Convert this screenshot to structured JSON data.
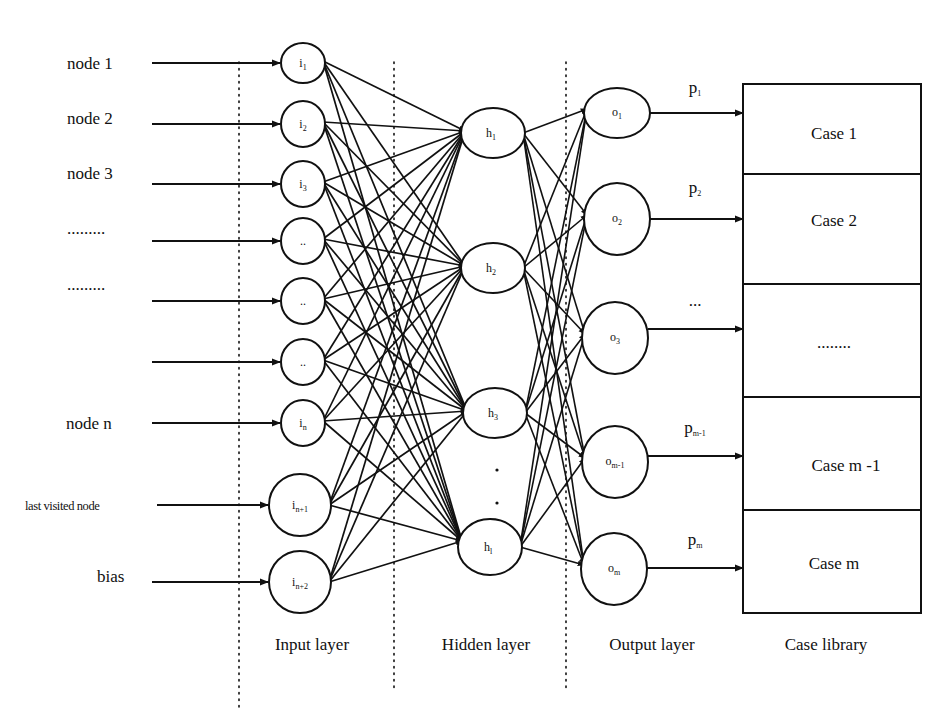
{
  "diagram": {
    "type": "neural-network-case-library",
    "colors": {
      "ink": "#111111",
      "background": "#ffffff"
    },
    "inputs": [
      {
        "label": "node 1",
        "y": 63,
        "lx": 67,
        "ly": 69,
        "small": false
      },
      {
        "label": "node 2",
        "y": 124,
        "lx": 67,
        "ly": 124,
        "small": false
      },
      {
        "label": "node 3",
        "y": 184,
        "lx": 67,
        "ly": 179,
        "small": false
      },
      {
        "label": ".........",
        "y": 241,
        "lx": 67,
        "ly": 234,
        "small": false
      },
      {
        "label": ".........",
        "y": 301,
        "lx": 67,
        "ly": 290,
        "small": false
      },
      {
        "label": "",
        "y": 362,
        "lx": 67,
        "ly": 362,
        "small": false
      },
      {
        "label": "node n",
        "y": 423,
        "lx": 66,
        "ly": 429,
        "small": false
      },
      {
        "label": "last visited node",
        "y": 505,
        "lx": 25,
        "ly": 510,
        "small": true
      },
      {
        "label": "bias",
        "y": 582,
        "lx": 97,
        "ly": 582,
        "small": false
      }
    ],
    "input_nodes": [
      {
        "id": "i1",
        "main": "i",
        "sub": "1",
        "cx": 303,
        "cy": 63,
        "rx": 22,
        "ry": 20
      },
      {
        "id": "i2",
        "main": "i",
        "sub": "2",
        "cx": 303,
        "cy": 124,
        "rx": 22,
        "ry": 23
      },
      {
        "id": "i3",
        "main": "i",
        "sub": "3",
        "cx": 303,
        "cy": 184,
        "rx": 22,
        "ry": 23
      },
      {
        "id": "i4",
        "main": "..",
        "sub": "",
        "cx": 303,
        "cy": 241,
        "rx": 22,
        "ry": 23
      },
      {
        "id": "i5",
        "main": "..",
        "sub": "",
        "cx": 303,
        "cy": 301,
        "rx": 22,
        "ry": 23
      },
      {
        "id": "i6",
        "main": "..",
        "sub": "",
        "cx": 303,
        "cy": 362,
        "rx": 22,
        "ry": 23
      },
      {
        "id": "in",
        "main": "i",
        "sub": "n",
        "cx": 303,
        "cy": 423,
        "rx": 22,
        "ry": 23
      },
      {
        "id": "in1",
        "main": "i",
        "sub": "n+1",
        "cx": 300,
        "cy": 505,
        "rx": 31,
        "ry": 31
      },
      {
        "id": "in2",
        "main": "i",
        "sub": "n+2",
        "cx": 300,
        "cy": 582,
        "rx": 31,
        "ry": 31
      }
    ],
    "hidden_nodes": [
      {
        "id": "h1",
        "main": "h",
        "sub": "1",
        "cx": 493,
        "cy": 133,
        "rx": 32,
        "ry": 25
      },
      {
        "id": "h2",
        "main": "h",
        "sub": "2",
        "cx": 493,
        "cy": 268,
        "rx": 32,
        "ry": 25
      },
      {
        "id": "h3",
        "main": "h",
        "sub": "3",
        "cx": 495,
        "cy": 413,
        "rx": 32,
        "ry": 25
      },
      {
        "id": "hl",
        "main": "h",
        "sub": "l",
        "cx": 490,
        "cy": 547,
        "rx": 32,
        "ry": 28
      }
    ],
    "hidden_ellipsis": [
      {
        "x": 497,
        "y": 470
      },
      {
        "x": 497,
        "y": 503
      }
    ],
    "output_nodes": [
      {
        "id": "o1",
        "main": "o",
        "sub": "1",
        "cx": 617,
        "cy": 113,
        "rx": 33,
        "ry": 25,
        "p": "p",
        "psub": "1",
        "py": 93
      },
      {
        "id": "o2",
        "main": "o",
        "sub": "2",
        "cx": 617,
        "cy": 219,
        "rx": 33,
        "ry": 36,
        "p": "p",
        "psub": "2",
        "py": 193
      },
      {
        "id": "o3",
        "main": "o",
        "sub": "3",
        "cx": 615,
        "cy": 338,
        "rx": 33,
        "ry": 36,
        "p": "...",
        "psub": "",
        "py": 306
      },
      {
        "id": "om1",
        "main": "o",
        "sub": "m-1",
        "cx": 615,
        "cy": 462,
        "rx": 33,
        "ry": 36,
        "p": "p",
        "psub": "m-1",
        "py": 433
      },
      {
        "id": "om",
        "main": "o",
        "sub": "m",
        "cx": 614,
        "cy": 569,
        "rx": 33,
        "ry": 36,
        "p": "p",
        "psub": "m",
        "py": 545
      }
    ],
    "case_library": {
      "x": 743,
      "width": 178,
      "top": 84,
      "rows": [
        {
          "label": "Case 1",
          "top": 84,
          "bottom": 174,
          "ty": 133,
          "arrow_y": 113
        },
        {
          "label": "Case 2",
          "top": 174,
          "bottom": 284,
          "ty": 220,
          "arrow_y": 219
        },
        {
          "label": "........",
          "top": 284,
          "bottom": 397,
          "ty": 342,
          "arrow_y": 329
        },
        {
          "label": "Case m -1",
          "top": 397,
          "bottom": 510,
          "ty": 465,
          "arrow_y": 456
        },
        {
          "label": "Case m",
          "top": 510,
          "bottom": 613,
          "ty": 563,
          "arrow_y": 568
        }
      ]
    },
    "layer_labels": [
      {
        "label": "Input layer",
        "x": 312,
        "y": 650
      },
      {
        "label": "Hidden layer",
        "x": 486,
        "y": 650
      },
      {
        "label": "Output layer",
        "x": 652,
        "y": 650
      },
      {
        "label": "Case library",
        "x": 826,
        "y": 650
      }
    ],
    "dotted_dividers": [
      {
        "x": 239,
        "y1": 62,
        "y2": 710
      },
      {
        "x": 394,
        "y1": 62,
        "y2": 692
      },
      {
        "x": 566,
        "y1": 62,
        "y2": 692
      }
    ],
    "input_arrow_start": 152
  }
}
